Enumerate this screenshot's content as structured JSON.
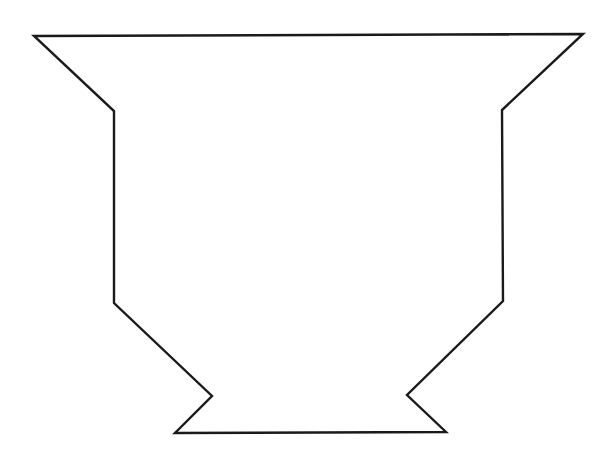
{
  "figure": {
    "stroke_color": "#1a1a1a",
    "fill_color": "#ffffff",
    "stroke_width": 2.4,
    "points": "34,36 583,34 502,110 503,301 407,395 446,432 175,433 212,396 114,303 114,111"
  }
}
